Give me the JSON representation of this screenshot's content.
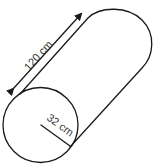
{
  "diagram": {
    "type": "cylinder",
    "orientation": "tilted, lying diagonally toward upper right",
    "length_label": "120 cm",
    "radius_label": "32 cm",
    "colors": {
      "stroke": "#1a1a1a",
      "text": "#333333",
      "background": "#ffffff"
    }
  }
}
